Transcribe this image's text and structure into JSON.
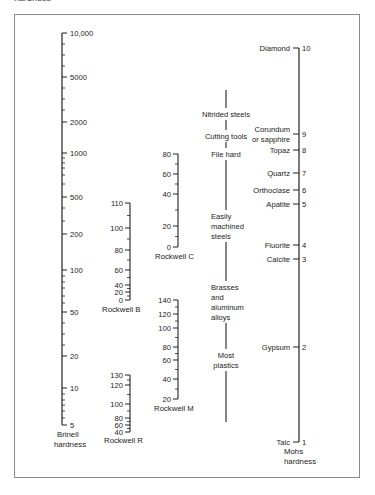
{
  "header": {
    "cut_text": "hardness"
  },
  "scales": {
    "brinell": {
      "title_line1": "Brinell",
      "title_line2": "hardness",
      "ticks": [
        {
          "label": "10,000",
          "y": 33
        },
        {
          "label": "5000",
          "y": 77
        },
        {
          "label": "2000",
          "y": 122
        },
        {
          "label": "1000",
          "y": 153
        },
        {
          "label": "500",
          "y": 197
        },
        {
          "label": "200",
          "y": 234
        },
        {
          "label": "100",
          "y": 270
        },
        {
          "label": "50",
          "y": 312
        },
        {
          "label": "20",
          "y": 356
        },
        {
          "label": "10",
          "y": 388
        },
        {
          "label": "5",
          "y": 425
        }
      ]
    },
    "rockwell_b": {
      "title": "Rockwell B",
      "ticks": [
        {
          "label": "110",
          "y": 203
        },
        {
          "label": "100",
          "y": 228
        },
        {
          "label": "80",
          "y": 250
        },
        {
          "label": "60",
          "y": 270
        },
        {
          "label": "40",
          "y": 285
        },
        {
          "label": "20",
          "y": 292
        },
        {
          "label": "0",
          "y": 300
        }
      ]
    },
    "rockwell_r": {
      "title": "Rockwell R",
      "ticks": [
        {
          "label": "130",
          "y": 375
        },
        {
          "label": "120",
          "y": 385
        },
        {
          "label": "100",
          "y": 404
        },
        {
          "label": "80",
          "y": 418
        },
        {
          "label": "60",
          "y": 425
        },
        {
          "label": "40",
          "y": 432
        }
      ]
    },
    "rockwell_c": {
      "title": "Rockwell C",
      "ticks": [
        {
          "label": "80",
          "y": 154
        },
        {
          "label": "60",
          "y": 174
        },
        {
          "label": "40",
          "y": 194
        },
        {
          "label": "20",
          "y": 226
        },
        {
          "label": "0",
          "y": 247
        }
      ]
    },
    "rockwell_m": {
      "title": "Rockwell M",
      "ticks": [
        {
          "label": "140",
          "y": 300
        },
        {
          "label": "120",
          "y": 314
        },
        {
          "label": "100",
          "y": 328
        },
        {
          "label": "80",
          "y": 347
        },
        {
          "label": "60",
          "y": 360
        },
        {
          "label": "40",
          "y": 379
        },
        {
          "label": "20",
          "y": 399
        }
      ]
    },
    "materials": {
      "items": [
        {
          "lines": [
            "Nitrided steels"
          ],
          "y": 117
        },
        {
          "lines": [
            "Cutting tools"
          ],
          "y": 139
        },
        {
          "lines": [
            "File hard"
          ],
          "y": 157
        },
        {
          "lines": [
            "Easily",
            "machined",
            "steels"
          ],
          "y": 219
        },
        {
          "lines": [
            "Brasses",
            "and",
            "aluminum",
            "alloys"
          ],
          "y": 290
        },
        {
          "lines": [
            "Most",
            "plastics"
          ],
          "y": 358
        }
      ]
    },
    "mohs": {
      "title_line1": "Mohs",
      "title_line2": "hardness",
      "ticks": [
        {
          "mineral": [
            "Diamond"
          ],
          "value": "10",
          "y": 48
        },
        {
          "mineral": [
            "Corundum",
            "or sapphire"
          ],
          "value": "9",
          "y": 134
        },
        {
          "mineral": [
            "Topaz"
          ],
          "value": "8",
          "y": 150
        },
        {
          "mineral": [
            "Quartz"
          ],
          "value": "7",
          "y": 173
        },
        {
          "mineral": [
            "Orthoclase"
          ],
          "value": "6",
          "y": 190
        },
        {
          "mineral": [
            "Apatite"
          ],
          "value": "5",
          "y": 204
        },
        {
          "mineral": [
            "Fluorite"
          ],
          "value": "4",
          "y": 245
        },
        {
          "mineral": [
            "Calcite"
          ],
          "value": "3",
          "y": 259
        },
        {
          "mineral": [
            "Gypsum"
          ],
          "value": "2",
          "y": 347
        },
        {
          "mineral": [
            "Talc"
          ],
          "value": "1",
          "y": 442
        }
      ]
    }
  }
}
